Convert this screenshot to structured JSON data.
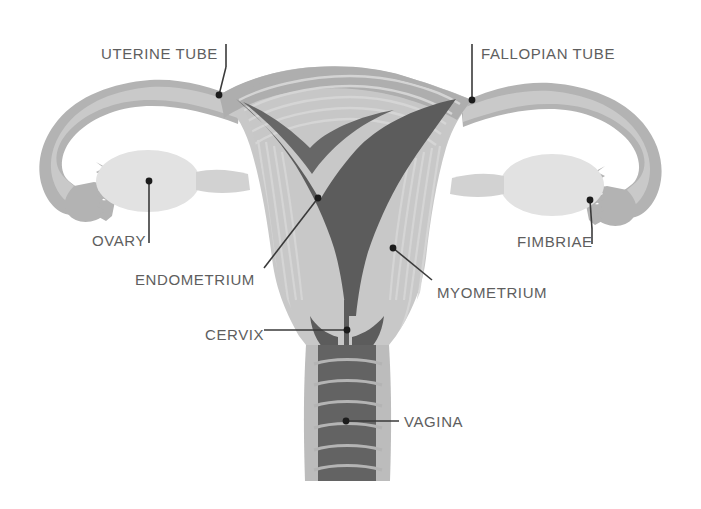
{
  "figure": {
    "width": 701,
    "height": 509,
    "background": "#ffffff"
  },
  "palette": {
    "background": "#ffffff",
    "tube_outer": "#b3b3b3",
    "tube_light": "#c9c9c9",
    "ovary": "#e2e2e2",
    "ovary_edge": "#d6d6d6",
    "myometrium_light": "#c8c8c8",
    "myometrium_mid": "#bdbdbd",
    "myometrium_stripe": "#d2d2d2",
    "cavity_dark": "#5c5c5c",
    "serosa": "#a8a8a8",
    "vagina_wall": "#bcbcbc",
    "vagina_lumen": "#636363",
    "label_text": "#5e5e5e",
    "leader_line": "#3a3a3a",
    "leader_dot": "#1c1c1c"
  },
  "labels": [
    {
      "id": "uterine-tube",
      "text": "UTERINE TUBE",
      "text_x": 101,
      "text_y": 46,
      "anchor": "start",
      "tick": {
        "x": 226,
        "y1": 44,
        "y2": 67
      },
      "leader": {
        "x1": 226,
        "y1": 67,
        "x2": 219,
        "y2": 95
      },
      "dot": {
        "x": 219,
        "y": 95
      }
    },
    {
      "id": "fallopian-tube",
      "text": "FALLOPIAN TUBE",
      "text_x": 481,
      "text_y": 46,
      "anchor": "start",
      "tick": {
        "x": 472,
        "y1": 44,
        "y2": 70
      },
      "leader": {
        "x1": 472,
        "y1": 70,
        "x2": 472,
        "y2": 100
      },
      "dot": {
        "x": 472,
        "y": 100
      }
    },
    {
      "id": "ovary",
      "text": "OVARY",
      "text_x": 92,
      "text_y": 233,
      "anchor": "start",
      "tick": {
        "x": 149,
        "y1": 229,
        "y2": 243
      },
      "leader": {
        "x1": 149,
        "y1": 229,
        "x2": 149,
        "y2": 181
      },
      "dot": {
        "x": 149,
        "y": 181
      }
    },
    {
      "id": "fimbriae",
      "text": "FIMBRIAE",
      "text_x": 517,
      "text_y": 234,
      "anchor": "start",
      "tick": {
        "x": 592,
        "y1": 229,
        "y2": 244
      },
      "leader": {
        "x1": 592,
        "y1": 229,
        "x2": 590,
        "y2": 200
      },
      "dot": {
        "x": 590,
        "y": 200
      }
    },
    {
      "id": "endometrium",
      "text": "ENDOMETRIUM",
      "text_x": 135,
      "text_y": 272,
      "anchor": "start",
      "leader": {
        "x1": 264,
        "y1": 268,
        "x2": 318,
        "y2": 198
      },
      "dot": {
        "x": 318,
        "y": 198
      }
    },
    {
      "id": "myometrium",
      "text": "MYOMETRIUM",
      "text_x": 437,
      "text_y": 285,
      "anchor": "start",
      "leader": {
        "x1": 432,
        "y1": 280,
        "x2": 393,
        "y2": 248
      },
      "dot": {
        "x": 393,
        "y": 248
      }
    },
    {
      "id": "cervix",
      "text": "CERVIX",
      "text_x": 205,
      "text_y": 327,
      "anchor": "start",
      "leader": {
        "x1": 264,
        "y1": 330,
        "x2": 347,
        "y2": 330
      },
      "dot": {
        "x": 347,
        "y": 330
      }
    },
    {
      "id": "vagina",
      "text": "VAGINA",
      "text_x": 404,
      "text_y": 414,
      "anchor": "start",
      "leader": {
        "x1": 399,
        "y1": 421,
        "x2": 346,
        "y2": 421
      },
      "dot": {
        "x": 346,
        "y": 421
      }
    }
  ],
  "structures": [
    {
      "id": "left-fallopian-tube",
      "name": "Left uterine (fallopian) tube"
    },
    {
      "id": "right-fallopian-tube",
      "name": "Right uterine (fallopian) tube"
    },
    {
      "id": "left-ovary",
      "name": "Left ovary"
    },
    {
      "id": "right-ovary",
      "name": "Right ovary"
    },
    {
      "id": "left-fimbriae",
      "name": "Left fimbriae"
    },
    {
      "id": "right-fimbriae",
      "name": "Right fimbriae"
    },
    {
      "id": "uterus-fundus",
      "name": "Uterine fundus"
    },
    {
      "id": "myometrium-wall",
      "name": "Myometrium"
    },
    {
      "id": "uterine-cavity",
      "name": "Endometrium / uterine cavity"
    },
    {
      "id": "cervix-canal",
      "name": "Cervix"
    },
    {
      "id": "vaginal-canal",
      "name": "Vagina"
    }
  ]
}
